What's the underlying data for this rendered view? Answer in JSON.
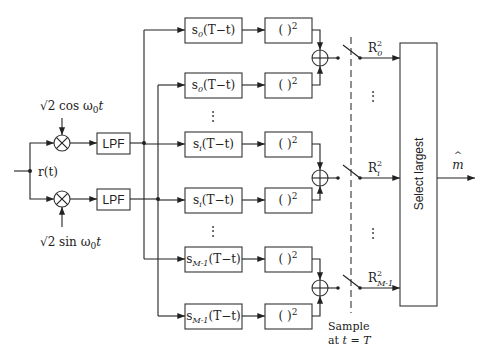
{
  "diagram": {
    "type": "block-diagram",
    "input": {
      "label": "r(t)"
    },
    "mixers": [
      {
        "id": "top-mixer",
        "reference": "√2 cos ω0t",
        "ref_main": "√2 cos ω",
        "ref_sub": "0",
        "ref_tail": "t"
      },
      {
        "id": "bottom-mixer",
        "reference": "√2 sin ω0t",
        "ref_main": "√2 sin ω",
        "ref_sub": "0",
        "ref_tail": "t"
      }
    ],
    "filters": [
      {
        "label": "LPF"
      },
      {
        "label": "LPF"
      }
    ],
    "matched_filters": [
      {
        "main": "s",
        "sub": "0",
        "arg": "(T−t)",
        "branch": "I"
      },
      {
        "main": "s",
        "sub": "0",
        "arg": "(T−t)",
        "branch": "Q"
      },
      {
        "main": "s",
        "sub": "i",
        "arg": "(T−t)",
        "branch": "I"
      },
      {
        "main": "s",
        "sub": "i",
        "arg": "(T−t)",
        "branch": "Q"
      },
      {
        "main": "s",
        "sub": "M-1",
        "arg": "(T−t)",
        "branch": "I"
      },
      {
        "main": "s",
        "sub": "M-1",
        "arg": "(T−t)",
        "branch": "Q"
      }
    ],
    "squarers": {
      "label": "( )",
      "power": "2"
    },
    "adders": [
      {
        "id": "adder-0"
      },
      {
        "id": "adder-i"
      },
      {
        "id": "adder-M-1"
      }
    ],
    "outputs": [
      {
        "main": "R",
        "sup": "2",
        "sub": "0"
      },
      {
        "main": "R",
        "sup": "2",
        "sub": "i"
      },
      {
        "main": "R",
        "sup": "2",
        "sub": "M-1"
      }
    ],
    "sampler": {
      "line1": "Sample",
      "line2_prefix": "at ",
      "line2_t": "t",
      "line2_eq": " = ",
      "line2_T": "T"
    },
    "decision": {
      "label": "Select largest"
    },
    "result": {
      "label": "m",
      "accent": "^"
    },
    "ellipsis": "⋮"
  }
}
